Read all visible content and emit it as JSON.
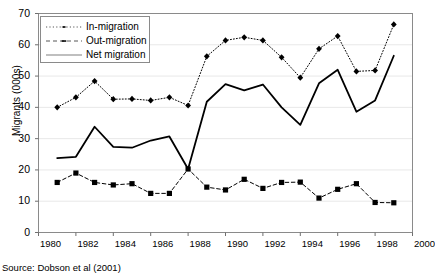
{
  "chart_data": {
    "type": "line",
    "title": "",
    "xlabel": "",
    "ylabel": "Migrants (000s)",
    "xlim": [
      1980,
      2000
    ],
    "ylim": [
      0,
      70
    ],
    "yticks": [
      0,
      10,
      20,
      30,
      40,
      50,
      60,
      70
    ],
    "xticks": [
      1980,
      1982,
      1984,
      1986,
      1988,
      1990,
      1992,
      1994,
      1996,
      1998,
      2000
    ],
    "grid": "horizontal",
    "legend_position": "top-left",
    "x": [
      1981,
      1982,
      1983,
      1984,
      1985,
      1986,
      1987,
      1988,
      1989,
      1990,
      1991,
      1992,
      1993,
      1994,
      1995,
      1996,
      1997,
      1998,
      1999
    ],
    "series": [
      {
        "name": "In-migration",
        "style": "dotted-diamond",
        "values": [
          40.0,
          43.2,
          48.4,
          42.6,
          42.7,
          42.2,
          43.2,
          40.6,
          56.3,
          61.4,
          62.4,
          61.4,
          56.0,
          49.5,
          58.7,
          62.8,
          51.5,
          51.8,
          66.5
        ]
      },
      {
        "name": "Out-migration",
        "style": "dashed-square",
        "values": [
          16.0,
          19.0,
          16.0,
          15.2,
          15.6,
          12.5,
          12.5,
          20.3,
          14.5,
          13.6,
          17.0,
          14.1,
          16.0,
          16.1,
          11.0,
          13.8,
          15.6,
          9.6,
          9.5
        ]
      },
      {
        "name": "Net migration",
        "style": "solid",
        "values": [
          23.8,
          24.2,
          33.8,
          27.4,
          27.1,
          29.4,
          30.7,
          20.3,
          41.8,
          47.4,
          45.4,
          47.3,
          40.0,
          34.4,
          47.7,
          52.0,
          38.6,
          42.2,
          56.5
        ]
      }
    ]
  },
  "legend": {
    "items": [
      {
        "label": "In-migration"
      },
      {
        "label": "Out-migration"
      },
      {
        "label": "Net migration"
      }
    ]
  },
  "source": "Source: Dobson et al (2001)",
  "colors": {
    "line": "#000000",
    "grid": "#e8e8e8",
    "frame": "#8a8a8a"
  }
}
